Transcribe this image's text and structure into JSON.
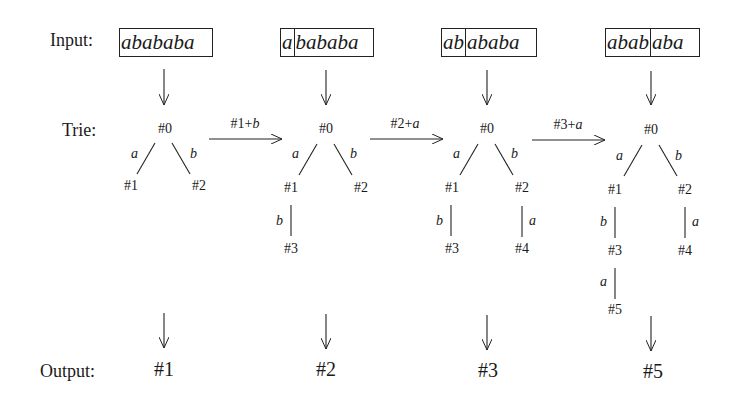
{
  "labels": {
    "input": "Input:",
    "trie": "Trie:",
    "output": "Output:"
  },
  "steps": [
    {
      "input_consumed": "",
      "input_rest": "abababa",
      "trie_nodes": [
        "#0",
        "#1",
        "#2"
      ],
      "edges": [
        {
          "from": "#0",
          "to": "#1",
          "label": "a"
        },
        {
          "from": "#0",
          "to": "#2",
          "label": "b"
        }
      ],
      "output": "#1"
    },
    {
      "input_consumed": "a",
      "input_rest": "bababa",
      "trie_nodes": [
        "#0",
        "#1",
        "#2",
        "#3"
      ],
      "edges": [
        {
          "from": "#0",
          "to": "#1",
          "label": "a"
        },
        {
          "from": "#0",
          "to": "#2",
          "label": "b"
        },
        {
          "from": "#1",
          "to": "#3",
          "label": "b"
        }
      ],
      "output": "#2"
    },
    {
      "input_consumed": "ab",
      "input_rest": "ababa",
      "trie_nodes": [
        "#0",
        "#1",
        "#2",
        "#3",
        "#4"
      ],
      "edges": [
        {
          "from": "#0",
          "to": "#1",
          "label": "a"
        },
        {
          "from": "#0",
          "to": "#2",
          "label": "b"
        },
        {
          "from": "#1",
          "to": "#3",
          "label": "b"
        },
        {
          "from": "#2",
          "to": "#4",
          "label": "a"
        }
      ],
      "output": "#3"
    },
    {
      "input_consumed": "abab",
      "input_rest": "aba",
      "trie_nodes": [
        "#0",
        "#1",
        "#2",
        "#3",
        "#4",
        "#5"
      ],
      "edges": [
        {
          "from": "#0",
          "to": "#1",
          "label": "a"
        },
        {
          "from": "#0",
          "to": "#2",
          "label": "b"
        },
        {
          "from": "#1",
          "to": "#3",
          "label": "b"
        },
        {
          "from": "#2",
          "to": "#4",
          "label": "a"
        },
        {
          "from": "#3",
          "to": "#5",
          "label": "a"
        }
      ],
      "output": "#5"
    }
  ],
  "transitions": [
    {
      "label_node": "#1",
      "label_plus": "+",
      "label_char": "b"
    },
    {
      "label_node": "#2",
      "label_plus": "+",
      "label_char": "a"
    },
    {
      "label_node": "#3",
      "label_plus": "+",
      "label_char": "a"
    }
  ]
}
